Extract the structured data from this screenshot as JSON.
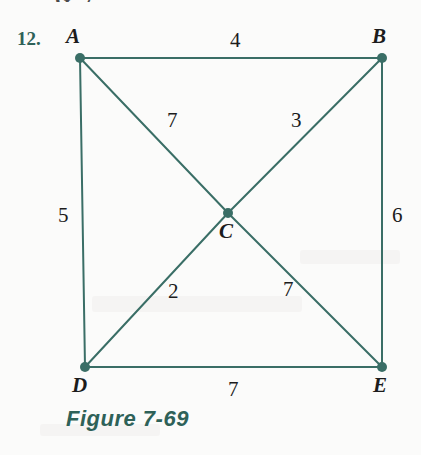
{
  "page": {
    "background_color": "#fbfbfa",
    "ink_color": "#3a6e66",
    "label_color": "#1c1c1c",
    "accent_color": "#2e6158",
    "width": 421,
    "height": 455
  },
  "problem": {
    "number_label": "12.",
    "caption": "Figure 7-69",
    "cropped_top_fragment": "G 7"
  },
  "chart_data": {
    "type": "diagram",
    "subtype": "weighted-graph",
    "title": "Figure 7-69",
    "nodes": [
      {
        "id": "A",
        "label": "A",
        "x": 80,
        "y": 58,
        "label_x": 66,
        "label_y": 26
      },
      {
        "id": "B",
        "label": "B",
        "x": 382,
        "y": 58,
        "label_x": 372,
        "label_y": 26
      },
      {
        "id": "C",
        "label": "C",
        "x": 228,
        "y": 213,
        "label_x": 219,
        "label_y": 221
      },
      {
        "id": "D",
        "label": "D",
        "x": 85,
        "y": 367,
        "label_x": 72,
        "label_y": 375
      },
      {
        "id": "E",
        "label": "E",
        "x": 382,
        "y": 367,
        "label_x": 373,
        "label_y": 375
      }
    ],
    "edges": [
      {
        "from": "A",
        "to": "B",
        "weight": "4",
        "label_x": 230,
        "label_y": 30
      },
      {
        "from": "A",
        "to": "D",
        "weight": "5",
        "label_x": 58,
        "label_y": 205
      },
      {
        "from": "B",
        "to": "E",
        "weight": "6",
        "label_x": 392,
        "label_y": 205
      },
      {
        "from": "D",
        "to": "E",
        "weight": "7",
        "label_x": 228,
        "label_y": 379
      },
      {
        "from": "A",
        "to": "C",
        "weight": "7",
        "label_x": 167,
        "label_y": 110
      },
      {
        "from": "B",
        "to": "C",
        "weight": "3",
        "label_x": 291,
        "label_y": 110
      },
      {
        "from": "C",
        "to": "D",
        "weight": "2",
        "label_x": 168,
        "label_y": 281
      },
      {
        "from": "C",
        "to": "E",
        "weight": "7",
        "label_x": 283,
        "label_y": 279
      }
    ],
    "node_radius": 5,
    "edge_width": 2,
    "grid": false,
    "legend": null
  }
}
